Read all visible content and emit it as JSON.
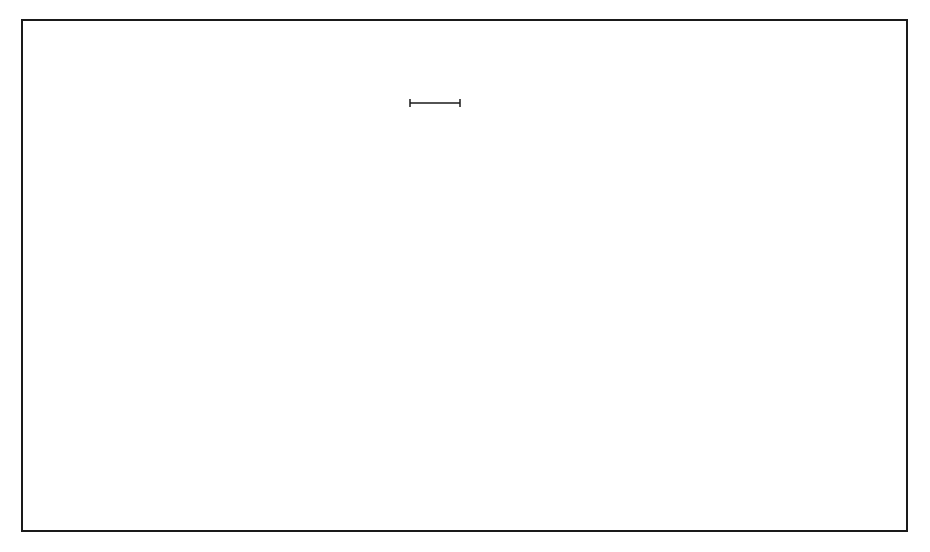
{
  "figure": {
    "type": "electron-optics field simulation",
    "frame": {
      "x0": 22,
      "y0": 20,
      "x1": 907,
      "y1": 531
    },
    "electrodes": [
      {
        "id": "OE",
        "label": "OE",
        "x0": 136,
        "x1": 209,
        "y1": 200,
        "chamfer": true
      },
      {
        "id": "PE",
        "label": "PE",
        "x0": 256,
        "x1": 329,
        "y1": 199,
        "chamfer": false
      },
      {
        "id": "G1",
        "label": "G1",
        "x0": 547,
        "x1": 619,
        "y1": 327,
        "chamfer": false
      },
      {
        "id": "SE",
        "label": "SE",
        "x0": 668,
        "x1": 740,
        "y1": 327,
        "chamfer": false
      },
      {
        "id": "G2",
        "label": "G2",
        "x0": 789,
        "x1": 861,
        "y1": 327,
        "chamfer": false
      }
    ],
    "scale_bar": {
      "label": "1 mm",
      "x0": 410,
      "x1": 460,
      "y": 103
    },
    "colors": {
      "line": "#1a1a1a",
      "faint": "#8a8a8a",
      "background": "#ffffff"
    }
  }
}
